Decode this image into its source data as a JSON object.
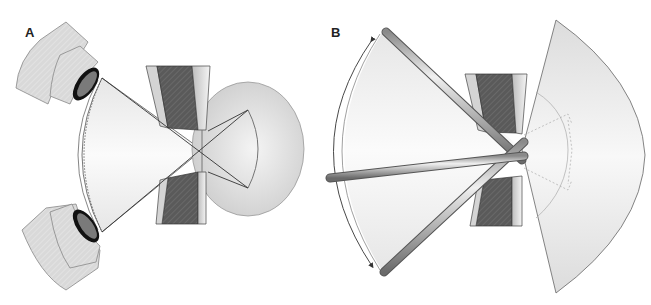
{
  "figure": {
    "panels": [
      {
        "label": "A",
        "description": "Two objective lenses aimed at a sample between pole pieces; converging beam cones crossing at focal point into a spherical detection volume",
        "components": [
          "objective-lens-top",
          "objective-lens-bottom",
          "beam-cone",
          "pole-piece-top",
          "pole-piece-bottom",
          "scatter-sphere",
          "angular-range-arc"
        ]
      },
      {
        "label": "B",
        "description": "Rotating rods sweeping through an angular range around a sample between pole pieces, with a large sector detector on the right",
        "components": [
          "rod-top",
          "rod-middle",
          "rod-bottom",
          "angular-range-arc",
          "pole-piece-top",
          "pole-piece-bottom",
          "sector-detector",
          "inner-sector-outline"
        ]
      }
    ]
  },
  "colors": {
    "pole_dark": "#555555",
    "pole_light": "#e8e8e8",
    "lens_body": "#d8d8d8",
    "lens_ring": "#111111",
    "lens_glass": "#777777",
    "cone_fill": "#f2f2f2",
    "sphere_fill": "#d6d6d6",
    "sector_fill": "#ececec",
    "rod": "#b8b8b8",
    "outline": "#444444"
  }
}
